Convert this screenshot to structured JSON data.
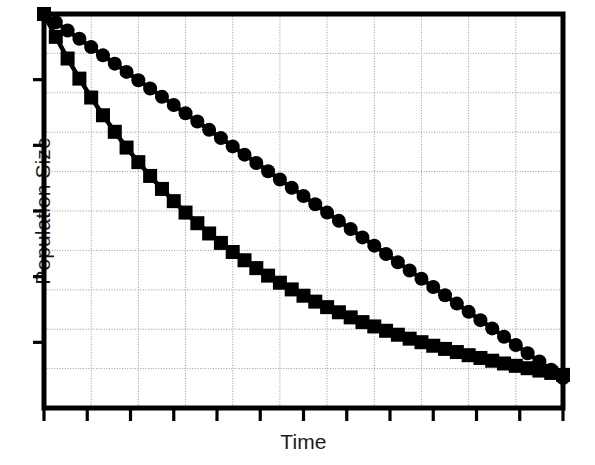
{
  "chart_data": {
    "type": "line",
    "title": "",
    "subtitle": "",
    "xlabel": "Time",
    "ylabel": "Population Size",
    "xlim": [
      0,
      100
    ],
    "ylim": [
      0,
      100
    ],
    "x_tick_labels": [],
    "y_tick_labels": [],
    "grid": true,
    "grid_style": "dotted",
    "grid_color": "#999999",
    "legend": null,
    "legend_position": "none",
    "axis_color": "#000000",
    "background_color": "#ffffff",
    "n_vertical_gridlines": 11,
    "n_horizontal_gridlines": 10,
    "n_x_ticks": 12,
    "n_y_ticks": 5,
    "series": [
      {
        "name": "series-circles",
        "marker": "circle",
        "marker_size": 14,
        "color": "#000000",
        "x": [
          0,
          2.27,
          4.55,
          6.82,
          9.09,
          11.36,
          13.64,
          15.91,
          18.18,
          20.45,
          22.73,
          25.0,
          27.27,
          29.55,
          31.82,
          34.09,
          36.36,
          38.64,
          40.91,
          43.18,
          45.45,
          47.73,
          50.0,
          52.27,
          54.55,
          56.82,
          59.09,
          61.36,
          63.64,
          65.91,
          68.18,
          70.45,
          72.73,
          75.0,
          77.27,
          79.55,
          81.82,
          84.09,
          86.36,
          88.64,
          90.91,
          93.18,
          95.45,
          97.73,
          100.0
        ],
        "y": [
          100.0,
          97.9,
          95.8,
          93.7,
          91.6,
          89.5,
          87.4,
          85.3,
          83.2,
          81.1,
          79.0,
          76.9,
          74.8,
          72.7,
          70.6,
          68.5,
          66.4,
          64.3,
          62.2,
          60.1,
          58.0,
          55.9,
          53.8,
          51.7,
          49.6,
          47.5,
          45.4,
          43.3,
          41.2,
          39.1,
          37.0,
          34.9,
          32.8,
          30.7,
          28.6,
          26.5,
          24.4,
          22.3,
          20.2,
          18.1,
          16.0,
          13.9,
          11.8,
          9.7,
          7.6
        ]
      },
      {
        "name": "series-squares",
        "marker": "square",
        "marker_size": 14,
        "color": "#000000",
        "x": [
          0,
          2.27,
          4.55,
          6.82,
          9.09,
          11.36,
          13.64,
          15.91,
          18.18,
          20.45,
          22.73,
          25.0,
          27.27,
          29.55,
          31.82,
          34.09,
          36.36,
          38.64,
          40.91,
          43.18,
          45.45,
          47.73,
          50.0,
          52.27,
          54.55,
          56.82,
          59.09,
          61.36,
          63.64,
          65.91,
          68.18,
          70.45,
          72.73,
          75.0,
          77.27,
          79.55,
          81.82,
          84.09,
          86.36,
          88.64,
          90.91,
          93.18,
          95.45,
          97.73,
          100.0
        ],
        "y": [
          100.0,
          94.2,
          88.7,
          83.6,
          78.8,
          74.3,
          70.1,
          66.1,
          62.4,
          58.9,
          55.6,
          52.5,
          49.6,
          46.9,
          44.3,
          41.9,
          39.6,
          37.5,
          35.5,
          33.6,
          31.8,
          30.1,
          28.5,
          27.0,
          25.6,
          24.3,
          23.0,
          21.8,
          20.7,
          19.6,
          18.6,
          17.6,
          16.7,
          15.8,
          15.0,
          14.2,
          13.4,
          12.7,
          12.0,
          11.3,
          10.7,
          10.1,
          9.5,
          8.9,
          8.4
        ]
      }
    ]
  },
  "labels": {
    "y_axis_title": "Population Size",
    "x_axis_title": "Time"
  },
  "colors": {
    "ink": "#000000",
    "grid": "#9a9a9a",
    "background": "#ffffff"
  }
}
